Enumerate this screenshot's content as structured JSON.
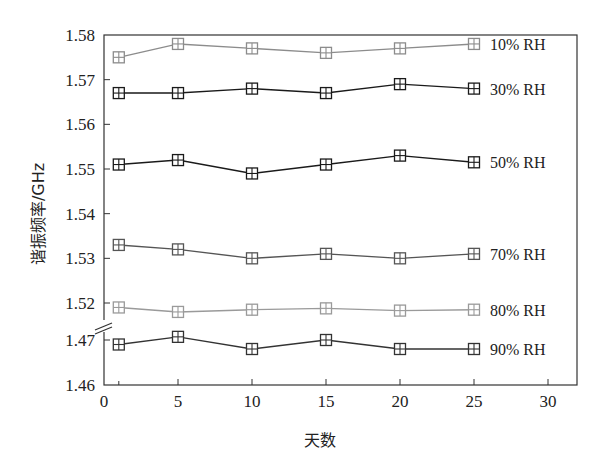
{
  "chart_data": {
    "type": "line",
    "title": "",
    "xlabel": "天数",
    "ylabel": "谐振频率/GHz",
    "x": [
      1,
      5,
      10,
      15,
      20,
      25
    ],
    "xlim": [
      0,
      30
    ],
    "xticks": [
      0,
      5,
      10,
      15,
      20,
      25,
      30
    ],
    "ylim": [
      1.46,
      1.58
    ],
    "y_axis_break": {
      "between": [
        1.47,
        1.52
      ]
    },
    "yticks": [
      1.46,
      1.47,
      1.52,
      1.53,
      1.54,
      1.55,
      1.56,
      1.57,
      1.58
    ],
    "yticks_labels": [
      "1.46",
      "1.47",
      "1.52",
      "1.53",
      "1.54",
      "1.55",
      "1.56",
      "1.57",
      "1.58"
    ],
    "grid": false,
    "legend_position": "inline-right",
    "marker": "square-with-cross",
    "series": [
      {
        "name": "10% RH",
        "color": "#8c8c8c",
        "values": [
          1.575,
          1.578,
          1.577,
          1.576,
          1.577,
          1.578
        ]
      },
      {
        "name": "30% RH",
        "color": "#1a1a1a",
        "values": [
          1.567,
          1.567,
          1.568,
          1.567,
          1.569,
          1.568
        ]
      },
      {
        "name": "50% RH",
        "color": "#1a1a1a",
        "values": [
          1.551,
          1.552,
          1.549,
          1.551,
          1.553,
          1.5515
        ]
      },
      {
        "name": "70% RH",
        "color": "#555555",
        "values": [
          1.533,
          1.532,
          1.53,
          1.531,
          1.53,
          1.531
        ]
      },
      {
        "name": "80% RH",
        "color": "#9a9a9a",
        "values": [
          1.519,
          1.518,
          1.5185,
          1.5188,
          1.5183,
          1.5185
        ]
      },
      {
        "name": "90% RH",
        "color": "#333333",
        "values": [
          1.469,
          1.4707,
          1.468,
          1.47,
          1.468,
          1.468
        ]
      }
    ]
  }
}
